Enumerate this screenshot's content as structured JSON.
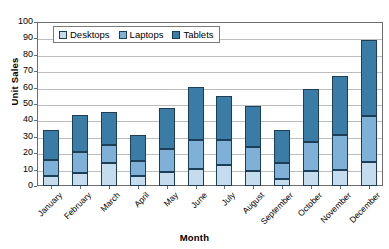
{
  "chart_data": {
    "type": "bar",
    "subtype": "stacked-column",
    "title": "",
    "xlabel": "Month",
    "ylabel": "Unit Sales",
    "ylim": [
      0,
      100
    ],
    "ytick_step": 10,
    "yticks": [
      0,
      10,
      20,
      30,
      40,
      50,
      60,
      70,
      80,
      90,
      100
    ],
    "grid": true,
    "legend_position": "top-left-inside",
    "categories": [
      "January",
      "February",
      "March",
      "April",
      "May",
      "June",
      "July",
      "August",
      "September",
      "October",
      "November",
      "December"
    ],
    "series": [
      {
        "name": "Desktops",
        "color": "#c5dcee",
        "values": [
          6,
          8,
          14,
          6,
          8.5,
          10.5,
          13,
          9,
          4,
          9,
          10,
          14.5
        ]
      },
      {
        "name": "Laptops",
        "color": "#7fb0d8",
        "values": [
          10,
          13,
          11,
          9.5,
          14,
          17.5,
          15,
          15,
          10,
          18,
          21,
          28
        ]
      },
      {
        "name": "Tablets",
        "color": "#3a7ca5",
        "values": [
          18,
          22,
          20,
          15.5,
          25,
          32.5,
          27,
          25,
          20,
          32,
          36,
          46.5
        ]
      }
    ],
    "totals": [
      34,
      43,
      45,
      31,
      47.5,
      60.5,
      55,
      49,
      34,
      59,
      67,
      89
    ]
  },
  "legend": {
    "items": [
      {
        "label": "Desktops",
        "color": "#c5dcee"
      },
      {
        "label": "Laptops",
        "color": "#7fb0d8"
      },
      {
        "label": "Tablets",
        "color": "#3a7ca5"
      }
    ]
  },
  "axes": {
    "y_title": "Unit Sales",
    "x_title": "Month"
  }
}
